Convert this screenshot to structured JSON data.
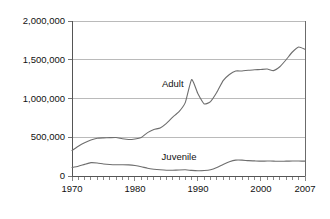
{
  "chart_data": {
    "type": "line",
    "title": "",
    "subtitle": "",
    "xlabel": "",
    "ylabel": "",
    "xlim": [
      1970,
      2007
    ],
    "ylim": [
      0,
      2000000
    ],
    "grid": true,
    "legend_position": "inline-annotation",
    "y_ticks": [
      0,
      500000,
      1000000,
      1500000,
      2000000
    ],
    "y_tick_labels": [
      "0",
      "500,000",
      "1,000,000",
      "1,500,000",
      "2,000,000"
    ],
    "x_ticks": [
      1970,
      1980,
      1990,
      2000,
      2007
    ],
    "x_tick_labels": [
      "1970",
      "1980",
      "1990",
      "2000",
      "2007"
    ],
    "x_minor_tick_interval": 1,
    "x": [
      1970,
      1971,
      1972,
      1973,
      1974,
      1975,
      1976,
      1977,
      1978,
      1979,
      1980,
      1981,
      1982,
      1983,
      1984,
      1985,
      1986,
      1987,
      1988,
      1989,
      1990,
      1991,
      1992,
      1993,
      1994,
      1995,
      1996,
      1997,
      1998,
      1999,
      2000,
      2001,
      2002,
      2003,
      2004,
      2005,
      2006,
      2007
    ],
    "series": [
      {
        "name": "Adult",
        "label": "Adult",
        "color": "#6e6e6e",
        "annotation_x": 1986.0,
        "annotation_y": 1180000,
        "values": [
          330000,
          385000,
          430000,
          465000,
          487000,
          492000,
          495000,
          497000,
          480000,
          470000,
          478000,
          498000,
          560000,
          600000,
          620000,
          680000,
          760000,
          830000,
          950000,
          1245000,
          1060000,
          930000,
          960000,
          1080000,
          1230000,
          1310000,
          1355000,
          1355000,
          1365000,
          1370000,
          1375000,
          1380000,
          1360000,
          1410000,
          1500000,
          1600000,
          1665000,
          1635000
        ]
      },
      {
        "name": "Juvenile",
        "label": "Juvenile",
        "color": "#6e6e6e",
        "annotation_x": 1987.0,
        "annotation_y": 245000,
        "values": [
          110000,
          125000,
          150000,
          172000,
          168000,
          155000,
          148000,
          145000,
          145000,
          143000,
          135000,
          120000,
          100000,
          88000,
          80000,
          75000,
          75000,
          78000,
          80000,
          72000,
          68000,
          70000,
          80000,
          110000,
          150000,
          185000,
          205000,
          205000,
          198000,
          195000,
          192000,
          193000,
          192000,
          190000,
          192000,
          193000,
          193000,
          192000
        ]
      }
    ]
  },
  "colors": {
    "background": "#ffffff",
    "gridline": "#a9a9a9",
    "axis": "#555555",
    "frame": "#6b6b6b",
    "line": "#6e6e6e",
    "text": "#111111"
  }
}
